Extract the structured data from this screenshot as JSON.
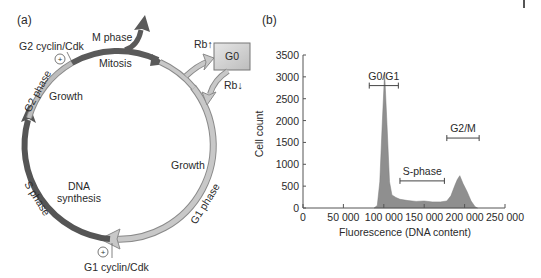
{
  "panel_a": {
    "label": "(a)",
    "labels": {
      "m_phase": "M phase",
      "mitosis": "Mitosis",
      "g2_cyclin": "G2 cyclin/Cdk",
      "g2_phase": "G2 phase",
      "growth_g2": "Growth",
      "s_phase": "S phase",
      "dna": "DNA",
      "synthesis": "synthesis",
      "g1_phase": "G1 phase",
      "growth_g1": "Growth",
      "g1_cyclin": "G1 cyclin/Cdk",
      "g0": "G0",
      "rb_up": "Rb↑",
      "rb_down": "Rb↓",
      "plus": "+"
    },
    "colors": {
      "m_phase": "#666666",
      "g2_phase": "#b8b8b8",
      "s_phase": "#6a6a6a",
      "g1_phase": "#c4c4c4",
      "g0_box": "#d0d0d0"
    }
  },
  "panel_b": {
    "label": "(b)"
  },
  "chart_data": {
    "type": "area",
    "title": "",
    "xlabel": "Fluorescence (DNA content)",
    "ylabel": "Cell count",
    "xlim": [
      0,
      250000
    ],
    "ylim": [
      0,
      3500
    ],
    "xticks": [
      0,
      50000,
      100000,
      150000,
      200000,
      250000
    ],
    "xtick_labels": [
      "0",
      "50 000",
      "100 000",
      "150 000",
      "200 000",
      "250 000"
    ],
    "yticks": [
      0,
      500,
      1000,
      1500,
      2000,
      2500,
      3000,
      3500
    ],
    "ytick_labels": [
      "0",
      "500",
      "1000",
      "1500",
      "2000",
      "2500",
      "3000",
      "3500"
    ],
    "grid": false,
    "series": [
      {
        "name": "DNA content histogram",
        "x": [
          88000,
          92000,
          95000,
          98000,
          101000,
          104000,
          107000,
          110000,
          115000,
          120000,
          130000,
          140000,
          150000,
          160000,
          170000,
          178000,
          183000,
          188000,
          191000,
          194000,
          198000,
          203000,
          208000,
          213000,
          216000
        ],
        "values": [
          0,
          60,
          600,
          1900,
          3100,
          1900,
          600,
          300,
          240,
          200,
          170,
          150,
          160,
          140,
          140,
          160,
          280,
          520,
          650,
          740,
          560,
          380,
          160,
          30,
          0
        ]
      }
    ],
    "annotations": [
      {
        "text": "G0/G1",
        "range": [
          82000,
          118000
        ],
        "y": 2800
      },
      {
        "text": "S-phase",
        "range": [
          120000,
          175000
        ],
        "y": 620
      },
      {
        "text": "G2/M",
        "range": [
          178000,
          218000
        ],
        "y": 1600
      }
    ]
  }
}
